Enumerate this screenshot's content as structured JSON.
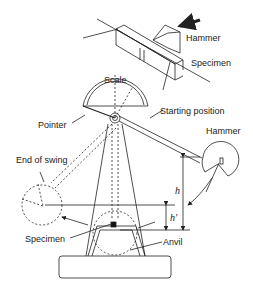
{
  "diagram": {
    "type": "charpy-impact-tester",
    "inset": {
      "labels": {
        "hammer": "Hammer",
        "specimen": "Specimen"
      }
    },
    "main": {
      "labels": {
        "scale": "Scale",
        "pointer": "Pointer",
        "starting_position": "Starting position",
        "hammer": "Hammer",
        "end_of_swing": "End of swing",
        "h": "h",
        "h_prime": "h'",
        "specimen": "Specimen",
        "anvil": "Anvil"
      }
    },
    "colors": {
      "line": "#222222",
      "background": "#ffffff",
      "specimen_fill": "#111111"
    }
  }
}
